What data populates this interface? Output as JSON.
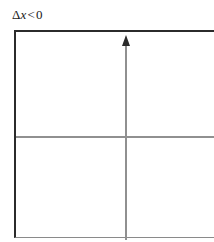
{
  "figure": {
    "condition_label": {
      "delta": "Δ",
      "variable": "x",
      "relation": "<",
      "value": "0",
      "full_text": "Δx < 0"
    },
    "colors": {
      "background": "#ffffff",
      "frame_dark": "#2b2b2b",
      "frame_light": "#8a8a8a",
      "axis": "#909090",
      "label_text": "#1a1a1a"
    }
  },
  "chart_data": {
    "type": "scatter",
    "subtitle": "",
    "xlabel": "",
    "ylabel": "",
    "annotations": [
      "Δx < 0"
    ],
    "series": [],
    "x": [],
    "values": [],
    "grid": false,
    "legend": false,
    "axes": {
      "origin_x": 125,
      "origin_y": 136,
      "x_axis_visible": true,
      "y_axis_visible": true,
      "y_axis_arrow": "up",
      "x_axis_arrow": "none"
    },
    "xlim": [
      null,
      null
    ],
    "ylim": [
      null,
      null
    ]
  }
}
